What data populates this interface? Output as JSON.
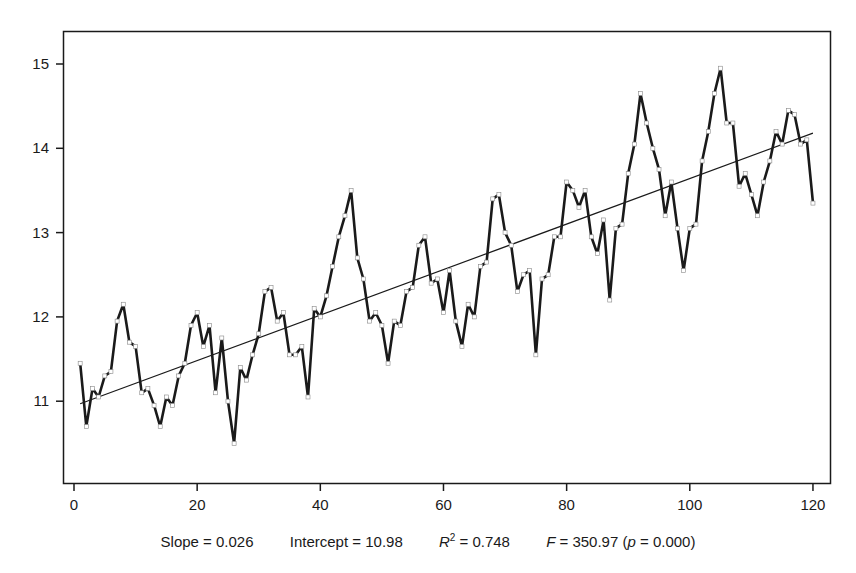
{
  "chart_data": {
    "type": "line",
    "title": "",
    "xlabel": "",
    "ylabel": "",
    "xlim": [
      0,
      122
    ],
    "ylim": [
      10.6,
      15.4
    ],
    "x_ticks": [
      0,
      20,
      40,
      60,
      80,
      100,
      120
    ],
    "y_ticks": [
      11,
      12,
      13,
      14,
      15
    ],
    "grid": false,
    "legend": null,
    "series": [
      {
        "name": "observed",
        "style": "thick line with small square markers",
        "x": [
          1,
          2,
          3,
          4,
          5,
          6,
          7,
          8,
          9,
          10,
          11,
          12,
          13,
          14,
          15,
          16,
          17,
          18,
          19,
          20,
          21,
          22,
          23,
          24,
          25,
          26,
          27,
          28,
          29,
          30,
          31,
          32,
          33,
          34,
          35,
          36,
          37,
          38,
          39,
          40,
          41,
          42,
          43,
          44,
          45,
          46,
          47,
          48,
          49,
          50,
          51,
          52,
          53,
          54,
          55,
          56,
          57,
          58,
          59,
          60,
          61,
          62,
          63,
          64,
          65,
          66,
          67,
          68,
          69,
          70,
          71,
          72,
          73,
          74,
          75,
          76,
          77,
          78,
          79,
          80,
          81,
          82,
          83,
          84,
          85,
          86,
          87,
          88,
          89,
          90,
          91,
          92,
          93,
          94,
          95,
          96,
          97,
          98,
          99,
          100,
          101,
          102,
          103,
          104,
          105,
          106,
          107,
          108,
          109,
          110,
          111,
          112,
          113,
          114,
          115,
          116,
          117,
          118,
          119,
          120
        ],
        "values": [
          11.45,
          10.7,
          11.15,
          11.05,
          11.3,
          11.35,
          11.95,
          12.15,
          11.7,
          11.65,
          11.1,
          11.15,
          10.95,
          10.7,
          11.05,
          10.95,
          11.3,
          11.45,
          11.9,
          12.05,
          11.65,
          11.9,
          11.1,
          11.75,
          11.0,
          10.5,
          11.4,
          11.25,
          11.55,
          11.8,
          12.3,
          12.35,
          11.95,
          12.05,
          11.55,
          11.55,
          11.65,
          11.05,
          12.1,
          12.0,
          12.25,
          12.6,
          12.95,
          13.2,
          13.5,
          12.7,
          12.45,
          11.95,
          12.05,
          11.9,
          11.45,
          11.95,
          11.9,
          12.3,
          12.35,
          12.85,
          12.95,
          12.4,
          12.45,
          12.05,
          12.55,
          11.95,
          11.65,
          12.15,
          12.0,
          12.6,
          12.65,
          13.4,
          13.45,
          13.0,
          12.85,
          12.3,
          12.5,
          12.55,
          11.55,
          12.45,
          12.5,
          12.95,
          12.95,
          13.6,
          13.5,
          13.3,
          13.5,
          12.95,
          12.75,
          13.15,
          12.2,
          13.05,
          13.1,
          13.7,
          14.05,
          14.65,
          14.3,
          14.0,
          13.75,
          13.2,
          13.6,
          13.05,
          12.55,
          13.05,
          13.1,
          13.85,
          14.2,
          14.65,
          14.95,
          14.3,
          14.3,
          13.55,
          13.7,
          13.45,
          13.2,
          13.6,
          13.85,
          14.2,
          14.05,
          14.45,
          14.4,
          14.05,
          14.1,
          13.35
        ]
      },
      {
        "name": "linear trend",
        "style": "thin line",
        "x": [
          1,
          120
        ],
        "values": [
          10.97,
          14.18
        ]
      }
    ],
    "annotations": {
      "slope": "0.026",
      "intercept": "10.98",
      "r_squared": "0.748",
      "f_stat": "350.97",
      "p_value": "0.000"
    }
  },
  "stats_text": {
    "slope_label": "Slope = 0.026",
    "intercept_label": "Intercept = 10.98",
    "r2_symbol": "R",
    "r2_sup": "2",
    "r2_value": " = 0.748",
    "f_symbol": "F",
    "f_value": " = 350.97 (",
    "p_symbol": "p",
    "p_value": " = 0.000)"
  },
  "colors": {
    "line": "#1a1a1a",
    "trend": "#1a1a1a",
    "marker_fill": "#ffffff",
    "frame": "#1a1a1a",
    "background": "#ffffff"
  }
}
